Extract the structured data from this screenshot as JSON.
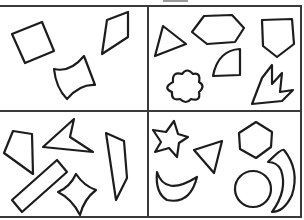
{
  "title": "Shapes worksheet",
  "colors": {
    "line": "#1c1c1c",
    "grid": "#3a3a3a",
    "background": "#ffffff",
    "tab": "#9a9a9a"
  },
  "panels": [
    {
      "id": "top-left",
      "shapes": [
        "square",
        "rhombus",
        "concave-quadrilateral"
      ]
    },
    {
      "id": "top-right",
      "shapes": [
        "triangle",
        "hexagon",
        "pentagon",
        "quarter-circle",
        "flower",
        "tulip"
      ]
    },
    {
      "id": "bottom-left",
      "shapes": [
        "quadrilateral",
        "concave-arrowhead",
        "trapezoid",
        "rectangle",
        "concave-diamond"
      ]
    },
    {
      "id": "bottom-right",
      "shapes": [
        "star",
        "triangle",
        "hexagon",
        "crescent",
        "circle",
        "crescent"
      ]
    }
  ]
}
